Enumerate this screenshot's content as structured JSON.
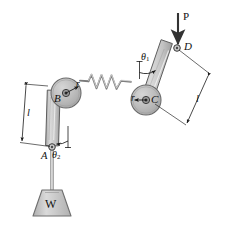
{
  "figure": {
    "kind": "mechanism-diagram",
    "width": 225,
    "height": 229,
    "background": "#ffffff",
    "stroke_color": "#1a1a1a",
    "pulley_fill": "#b9b9b9",
    "link_fill": "#c9c9c9",
    "weight_fill": "#c4c4c4"
  },
  "labels": {
    "force_p": "P",
    "point_d": "D",
    "point_c": "C",
    "point_b": "B",
    "point_a": "A",
    "weight": "W",
    "radius_right": "r",
    "radius_left": "r",
    "length_right": "l",
    "length_left": "l",
    "angle_one": "θ",
    "angle_one_sub": "1",
    "angle_two": "θ",
    "angle_two_sub": "2"
  },
  "geometry": {
    "pulley_left": {
      "cx": 66,
      "cy": 93,
      "r": 15
    },
    "pulley_right": {
      "cx": 146,
      "cy": 100,
      "r": 15
    },
    "point_a": {
      "x": 52,
      "y": 148
    },
    "point_d": {
      "x": 177,
      "y": 48
    },
    "spring": {
      "x1": 84,
      "y1": 81,
      "x2": 128,
      "y2": 86,
      "coils": 4
    },
    "force_arrow": {
      "x": 178,
      "y1": 13,
      "y2": 45
    }
  }
}
